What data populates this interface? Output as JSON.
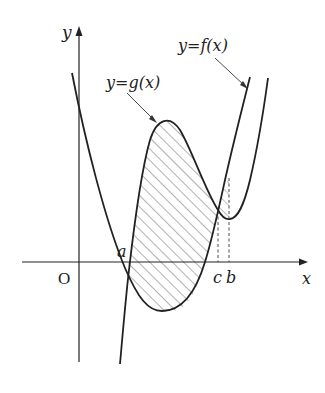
{
  "diagram": {
    "type": "function-graph",
    "axes": {
      "x_label": "x",
      "y_label": "y",
      "origin_label": "O"
    },
    "curves": [
      {
        "id": "f",
        "label": "y=f(x)",
        "shape": "parabola opening upward"
      },
      {
        "id": "g",
        "label": "y=g(x)",
        "shape": "cubic-like with local max and local min"
      }
    ],
    "points": [
      {
        "label": "a",
        "description": "left intersection of f and g"
      },
      {
        "label": "c",
        "description": "right intersection of f and g"
      },
      {
        "label": "b",
        "description": "local minimum of g"
      }
    ],
    "shaded_region": "area between g(x) and f(x) from a to c (hatched)",
    "colors": {
      "stroke": "#222222",
      "background": "#ffffff",
      "hatch": "#444444"
    }
  },
  "labels": {
    "y_axis": "y",
    "x_axis": "x",
    "origin": "O",
    "f_label": "y=f(x)",
    "g_label": "y=g(x)",
    "point_a": "a",
    "point_c": "c",
    "point_b": "b"
  }
}
